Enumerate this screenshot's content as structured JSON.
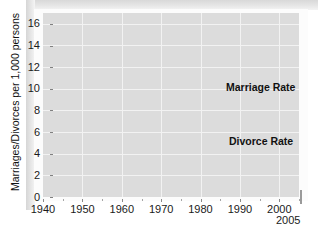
{
  "chart_data": {
    "type": "line",
    "title": "",
    "xlabel": "",
    "ylabel": "Marriages/Divorces per 1,000 persons",
    "xlim": [
      1940,
      2005
    ],
    "ylim": [
      0,
      17
    ],
    "grid": true,
    "legend_position": "inline-annotation",
    "x_ticks": [
      "1940",
      "1950",
      "1960",
      "1970",
      "1980",
      "1990",
      "2000"
    ],
    "x_tick_values": [
      1940,
      1950,
      1960,
      1970,
      1980,
      1990,
      2000
    ],
    "x_end_label": "2005",
    "y_ticks": [
      "0",
      "2",
      "4",
      "6",
      "8",
      "10",
      "12",
      "14",
      "16"
    ],
    "y_tick_values": [
      0,
      2,
      4,
      6,
      8,
      10,
      12,
      14,
      16
    ],
    "x": [
      1940,
      1941,
      1942,
      1943,
      1944,
      1945,
      1946,
      1947,
      1948,
      1949,
      1950,
      1951,
      1952,
      1953,
      1954,
      1955,
      1956,
      1957,
      1958,
      1959,
      1960,
      1961,
      1962,
      1963,
      1964,
      1965,
      1966,
      1967,
      1968,
      1969,
      1970,
      1971,
      1972,
      1973,
      1974,
      1975,
      1976,
      1977,
      1978,
      1979,
      1980,
      1981,
      1982,
      1983,
      1984,
      1985,
      1986,
      1987,
      1988,
      1989,
      1990,
      1991,
      1992,
      1993,
      1994,
      1995,
      1996,
      1997,
      1998,
      1999,
      2000,
      2001,
      2002,
      2003,
      2004,
      2005
    ],
    "series": [
      {
        "name": "Marriage Rate",
        "color": "#3a3a3a",
        "values": [
          12.1,
          12.7,
          13.2,
          11.7,
          10.9,
          12.3,
          16.2,
          13.9,
          12.4,
          10.6,
          11.1,
          10.4,
          9.9,
          9.8,
          9.2,
          9.3,
          9.5,
          8.9,
          8.4,
          8.5,
          8.5,
          8.5,
          8.5,
          8.8,
          9.0,
          9.3,
          9.5,
          9.7,
          10.4,
          10.6,
          10.6,
          10.6,
          10.9,
          10.8,
          10.5,
          10.0,
          9.9,
          9.9,
          10.3,
          10.4,
          10.6,
          10.6,
          10.6,
          10.5,
          10.5,
          10.1,
          10.0,
          9.9,
          9.8,
          9.7,
          9.8,
          9.4,
          9.3,
          9.0,
          9.1,
          8.9,
          8.8,
          8.9,
          8.3,
          8.6,
          8.5,
          8.4,
          8.0,
          7.7,
          7.4,
          7.4
        ],
        "linewidth": 2
      },
      {
        "name": "Divorce Rate",
        "color": "#3a3a3a",
        "values": [
          2.0,
          2.2,
          2.4,
          2.6,
          2.9,
          3.5,
          4.3,
          3.4,
          2.8,
          2.7,
          2.6,
          2.5,
          2.5,
          2.5,
          2.4,
          2.3,
          2.3,
          2.2,
          2.1,
          2.2,
          2.2,
          2.3,
          2.2,
          2.3,
          2.4,
          2.5,
          2.5,
          2.6,
          2.9,
          3.2,
          3.5,
          3.7,
          4.0,
          4.3,
          4.6,
          4.8,
          5.0,
          5.0,
          5.1,
          5.3,
          5.2,
          5.3,
          5.1,
          5.0,
          5.0,
          5.0,
          4.9,
          4.8,
          4.8,
          4.7,
          4.7,
          4.7,
          4.8,
          4.6,
          4.6,
          4.4,
          4.3,
          4.3,
          3.4,
          4.1,
          4.1,
          4.0,
          3.9,
          3.8,
          3.7,
          3.6
        ],
        "linewidth": 2
      }
    ],
    "annotations": [
      {
        "text": "Marriage Rate",
        "x": 1983,
        "y": 11.9
      },
      {
        "text": "Divorce Rate",
        "x": 1984,
        "y": 6.4
      }
    ],
    "colors": {
      "plot_background": "#dcdcdc",
      "gridline": "#f2f2f2",
      "line": "#3a3a3a",
      "text": "#111111",
      "page_background": "#ffffff"
    }
  }
}
